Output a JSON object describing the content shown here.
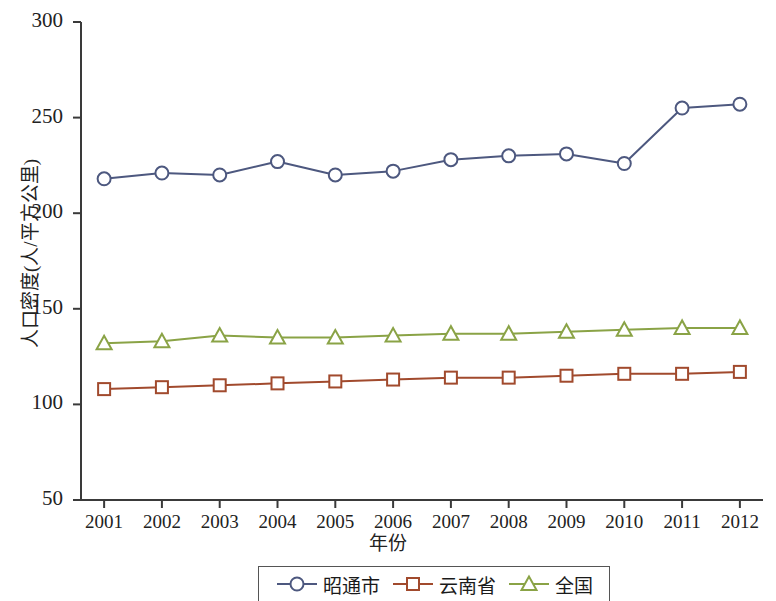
{
  "chart_data": {
    "type": "line",
    "title": "",
    "xlabel": "年份",
    "ylabel": "人口密度(人/平方公里)",
    "categories": [
      "2001",
      "2002",
      "2003",
      "2004",
      "2005",
      "2006",
      "2007",
      "2008",
      "2009",
      "2010",
      "2011",
      "2012"
    ],
    "x": [
      2001,
      2002,
      2003,
      2004,
      2005,
      2006,
      2007,
      2008,
      2009,
      2010,
      2011,
      2012
    ],
    "ylim": [
      50,
      300
    ],
    "xlim": [
      2000.6,
      2012.4
    ],
    "yticks": [
      50,
      100,
      150,
      200,
      250,
      300
    ],
    "ytick_labels": [
      "50",
      "100",
      "150",
      "200",
      "250",
      "300"
    ],
    "grid": false,
    "legend_position": "bottom-center",
    "series": [
      {
        "name": "昭通市",
        "color": "#4d587f",
        "marker": "circle",
        "values": [
          218,
          221,
          220,
          227,
          220,
          222,
          228,
          230,
          231,
          226,
          255,
          257
        ]
      },
      {
        "name": "云南省",
        "color": "#a14a2d",
        "marker": "square",
        "values": [
          108,
          109,
          110,
          111,
          112,
          113,
          114,
          114,
          115,
          116,
          116,
          117
        ]
      },
      {
        "name": "全国",
        "color": "#8aa346",
        "marker": "triangle",
        "values": [
          132,
          133,
          136,
          135,
          135,
          136,
          137,
          137,
          138,
          139,
          140,
          140
        ]
      }
    ]
  },
  "axes": {
    "axis_color": "#3a3a3a"
  },
  "legend": {
    "items": [
      {
        "label": "昭通市",
        "marker": "circle-marker-icon",
        "color": "#4d587f"
      },
      {
        "label": "云南省",
        "marker": "square-marker-icon",
        "color": "#a14a2d"
      },
      {
        "label": "全国",
        "marker": "triangle-marker-icon",
        "color": "#8aa346"
      }
    ]
  }
}
